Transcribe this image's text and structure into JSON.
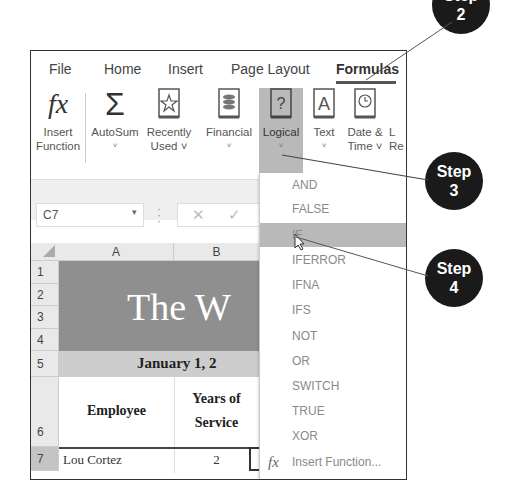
{
  "ribbon": {
    "tabs": [
      {
        "label": "File",
        "active": false
      },
      {
        "label": "Home",
        "active": false
      },
      {
        "label": "Insert",
        "active": false
      },
      {
        "label": "Page Layout",
        "active": false
      },
      {
        "label": "Formulas",
        "active": true
      }
    ],
    "buttons": [
      {
        "label_line1": "Insert",
        "label_line2": "Function",
        "icon": "fx-icon"
      },
      {
        "label_line1": "AutoSum",
        "label_line2": "˅",
        "icon": "sigma-icon"
      },
      {
        "label_line1": "Recently",
        "label_line2": "Used ˅",
        "icon": "star-book-icon"
      },
      {
        "label_line1": "Financial",
        "label_line2": "˅",
        "icon": "coins-book-icon"
      },
      {
        "label_line1": "Logical",
        "label_line2": "˅",
        "icon": "question-book-icon"
      },
      {
        "label_line1": "Text",
        "label_line2": "˅",
        "icon": "letter-a-book-icon"
      },
      {
        "label_line1": "Date &",
        "label_line2": "Time ˅",
        "icon": "clock-book-icon"
      },
      {
        "label_line1": "L",
        "label_line2": "Re",
        "icon": "lookup-icon"
      }
    ]
  },
  "formula_bar": {
    "name_box": "C7",
    "cancel_icon": "✕",
    "enter_icon": "✓"
  },
  "sheet": {
    "columns": [
      "A",
      "B"
    ],
    "rows": [
      "1",
      "2",
      "3",
      "4",
      "5",
      "6",
      "7"
    ],
    "title": "The W",
    "date": "January 1, 2",
    "headers": {
      "employee": "Employee",
      "years_line1": "Years of",
      "years_line2": "Service"
    },
    "row7": {
      "employee": "Lou Cortez",
      "years": "2"
    }
  },
  "dropdown": {
    "items": [
      "AND",
      "FALSE",
      "IF",
      "IFERROR",
      "IFNA",
      "IFS",
      "NOT",
      "OR",
      "SWITCH",
      "TRUE",
      "XOR"
    ],
    "highlighted": "IF",
    "footer_icon": "fx",
    "footer_label": "Insert Function..."
  },
  "callouts": [
    {
      "word": "Step",
      "number": "2"
    },
    {
      "word": "Step",
      "number": "3"
    },
    {
      "word": "Step",
      "number": "4"
    }
  ],
  "colors": {
    "badge": "#1a1a1a",
    "highlight": "#b9b9b9",
    "title_band": "#8f8f8f",
    "date_band": "#cdcdcd"
  }
}
